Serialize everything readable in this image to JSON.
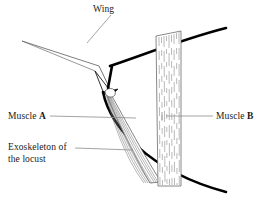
{
  "diagram": {
    "subject": "locust",
    "labels": {
      "wing": "Wing",
      "muscle_a_prefix": "Muscle ",
      "muscle_a_letter": "A",
      "muscle_b_prefix": "Muscle ",
      "muscle_b_letter": "B",
      "exoskeleton_line1": "Exoskeleton of",
      "exoskeleton_line2": "the locust"
    },
    "colors": {
      "background": "#ffffff",
      "ink": "#111111",
      "exoskeleton": "#000000",
      "leader_line": "#8b8b8b",
      "muscle_fiber": "#6f6f6f",
      "muscle_outline": "#555555",
      "text": "#1a1a1a"
    },
    "parts": [
      {
        "name": "wing",
        "kind": "appendage",
        "label": "Wing"
      },
      {
        "name": "muscle-a",
        "kind": "muscle",
        "label": "Muscle A"
      },
      {
        "name": "muscle-b",
        "kind": "muscle",
        "label": "Muscle B"
      },
      {
        "name": "exoskeleton",
        "kind": "skeleton",
        "label": "Exoskeleton of the locust"
      },
      {
        "name": "wing-hinge",
        "kind": "joint",
        "label": ""
      }
    ],
    "leaders": [
      {
        "name": "wing-leader",
        "from": [
          110,
          14
        ],
        "to": [
          88,
          42
        ]
      },
      {
        "name": "muscle-a-leader",
        "from": [
          48,
          116
        ],
        "to": [
          135,
          118
        ]
      },
      {
        "name": "muscle-b-leader",
        "from": [
          213,
          116
        ],
        "to": [
          166,
          116
        ]
      },
      {
        "name": "exoskeleton-leader",
        "from": [
          73,
          148
        ],
        "to": [
          132,
          150
        ]
      }
    ],
    "geometry": {
      "exoskeleton_upper": "M 110 66 C 140 56, 185 38, 226 28",
      "exoskeleton_lower": "M 103 92 C 112 128, 150 172, 226 192",
      "muscle_b_left_x": 156,
      "muscle_b_right_x": 181,
      "muscle_b_top_y": 34,
      "muscle_b_bottom_y": 186,
      "muscle_b_fiber_count": 11,
      "muscle_a_fiber_count": 9,
      "muscle_a_origin": [
        110,
        93
      ],
      "muscle_a_insertion": [
        160,
        182
      ]
    }
  }
}
